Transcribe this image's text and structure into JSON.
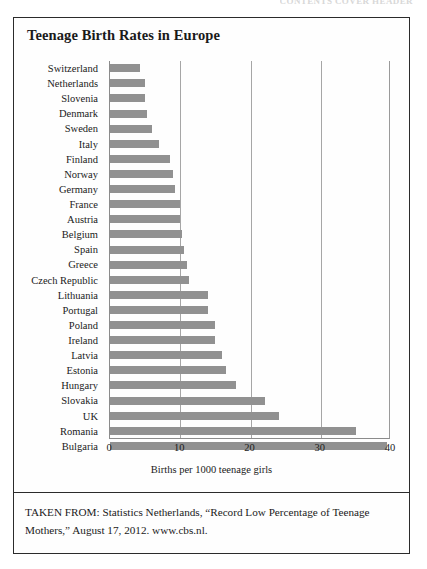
{
  "page": {
    "top_cut_text": "CONTENTS  COVER  HEADER",
    "background_color": "#ffffff",
    "border_color": "#2b2b2b"
  },
  "chart": {
    "title": "Teenage Birth Rates in Europe",
    "bar_color": "#919191",
    "gridline_color": "#a6a6a6"
  },
  "source": {
    "caption": "TAKEN FROM: Statistics Netherlands, “Record Low Percentage of Teenage Mothers,” August 17, 2012. www.cbs.nl."
  },
  "chart_data": {
    "type": "bar",
    "orientation": "horizontal",
    "title": "Teenage Birth Rates in Europe",
    "subtitle": "",
    "xlabel": "Births per 1000 teenage girls",
    "ylabel": "",
    "xlim": [
      0,
      40
    ],
    "xticks": [
      0,
      10,
      20,
      30,
      40
    ],
    "xtick_labels": [
      "0",
      "10",
      "20",
      "30",
      "40"
    ],
    "grid": true,
    "grid_axis": "x",
    "legend": false,
    "legend_position": "none",
    "bar_color": "#919191",
    "categories": [
      "Switzerland",
      "Netherlands",
      "Slovenia",
      "Denmark",
      "Sweden",
      "Italy",
      "Finland",
      "Norway",
      "Germany",
      "France",
      "Austria",
      "Belgium",
      "Spain",
      "Greece",
      "Czech Republic",
      "Lithuania",
      "Portugal",
      "Poland",
      "Ireland",
      "Latvia",
      "Estonia",
      "Hungary",
      "Slovakia",
      "UK",
      "Romania",
      "Bulgaria"
    ],
    "values": [
      4.3,
      5.0,
      5.0,
      5.2,
      6.0,
      7.0,
      8.5,
      9.0,
      9.3,
      10.0,
      10.0,
      10.3,
      10.5,
      11.0,
      11.2,
      14.0,
      14.0,
      15.0,
      15.0,
      16.0,
      16.5,
      18.0,
      22.0,
      24.0,
      35.0,
      39.5
    ]
  }
}
